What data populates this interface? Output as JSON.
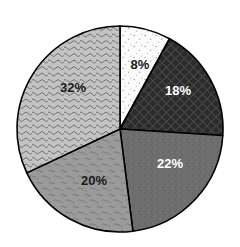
{
  "chart_data": {
    "type": "pie",
    "title": "",
    "subtitle": "",
    "xlabel": "",
    "ylabel": "",
    "grid": false,
    "legend": "none",
    "units": "percent",
    "total": 100,
    "start_angle_deg": 0,
    "direction": "clockwise",
    "categories": [
      "8%",
      "18%",
      "22%",
      "20%",
      "32%"
    ],
    "values": [
      8,
      18,
      22,
      20,
      32
    ],
    "data_labels": [
      "8%",
      "18%",
      "22%",
      "20%",
      "32%"
    ],
    "slices": [
      {
        "label": "8%",
        "value": 8,
        "start_deg": 0,
        "end_deg": 28.8,
        "fill": "#fbfbfb",
        "pattern": "sparse-dots",
        "label_color": "#1a1a1a",
        "label_x": 140,
        "label_y": 66
      },
      {
        "label": "18%",
        "value": 18,
        "start_deg": 28.8,
        "end_deg": 93.6,
        "fill": "#2b2b2b",
        "pattern": "diagonal-crosshatch",
        "label_color": "#ffffff",
        "label_x": 178,
        "label_y": 92
      },
      {
        "label": "22%",
        "value": 22,
        "start_deg": 93.6,
        "end_deg": 172.8,
        "fill": "#6e6e6e",
        "pattern": "fine-speckle",
        "label_color": "#ffffff",
        "label_x": 170,
        "label_y": 165
      },
      {
        "label": "20%",
        "value": 20,
        "start_deg": 172.8,
        "end_deg": 244.8,
        "fill": "#9b9b9b",
        "pattern": "small-squiggle",
        "label_color": "#1a1a1a",
        "label_x": 94,
        "label_y": 182
      },
      {
        "label": "32%",
        "value": 32,
        "start_deg": 244.8,
        "end_deg": 360,
        "fill": "#c3c3c3",
        "pattern": "wavy-squiggle",
        "label_color": "#1a1a1a",
        "label_x": 73,
        "label_y": 89
      }
    ],
    "geometry": {
      "center_x": 120,
      "center_y": 129,
      "radius": 103
    },
    "style": {
      "background": "#ffffff",
      "outline": "#000000",
      "outline_width": 1.6
    }
  }
}
